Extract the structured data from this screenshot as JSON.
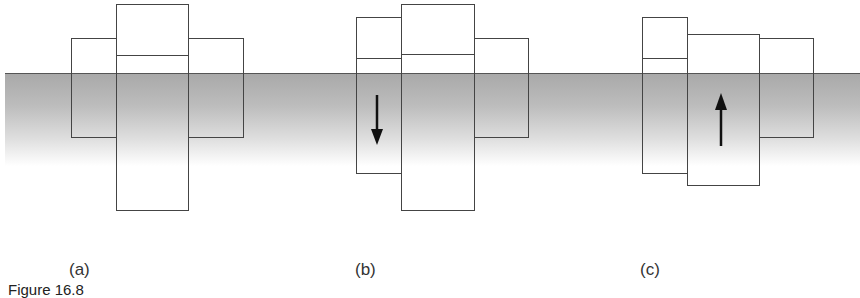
{
  "figure": {
    "panels": [
      {
        "label": "(a)",
        "arrow": "none"
      },
      {
        "label": "(b)",
        "arrow": "down"
      },
      {
        "label": "(c)",
        "arrow": "up"
      }
    ],
    "caption": "Figure 16.8"
  }
}
